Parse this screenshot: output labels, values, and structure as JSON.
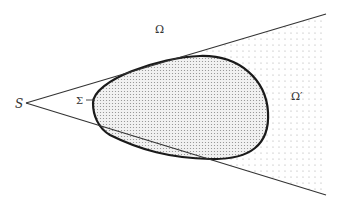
{
  "diagram": {
    "type": "geometric-region",
    "labels": {
      "vertex": "S",
      "curve": "Σ",
      "outer_region": "Ω",
      "inner_region": "Ω′"
    },
    "colors": {
      "line": "#333333",
      "curve": "#1a1a1a",
      "dots_dense": "#888888",
      "dots_sparse": "#aaaaaa",
      "blob_fill": "#eeeeee",
      "background": "#ffffff"
    }
  }
}
